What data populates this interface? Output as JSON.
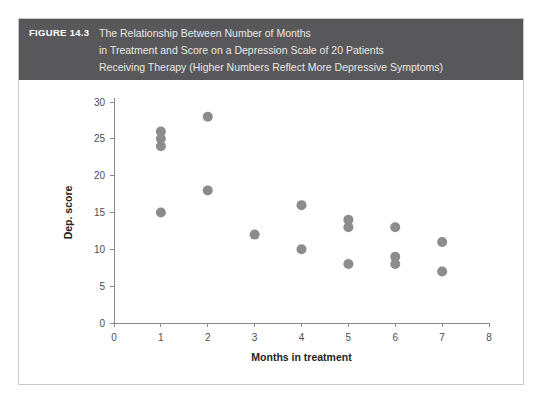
{
  "figure": {
    "number_label": "FIGURE 14.3",
    "caption_lines": [
      "The Relationship Between Number of Months",
      "in Treatment and Score on a Depression Scale of 20 Patients",
      "Receiving Therapy (Higher Numbers Reflect More Depressive Symptoms)"
    ]
  },
  "colors": {
    "band_background": "#58585a",
    "band_number_text": "#ffffff",
    "band_caption_text": "#e9e7e2",
    "marker": "#8c8c8e",
    "axis": "#8a8a8a",
    "frame_border": "#c9c9c9",
    "plot_background": "#ffffff"
  },
  "chart_data": {
    "type": "scatter",
    "title": "",
    "xlabel": "Months in treatment",
    "ylabel": "Dep. score",
    "xlim": [
      0,
      8
    ],
    "ylim": [
      0,
      30
    ],
    "xticks": [
      0,
      1,
      2,
      3,
      4,
      5,
      6,
      7,
      8
    ],
    "xtick_labels": [
      "0",
      "1",
      "2",
      "3",
      "4",
      "5",
      "6",
      "7",
      "8"
    ],
    "yticks": [
      0,
      5,
      10,
      15,
      20,
      25,
      30
    ],
    "ytick_labels": [
      "0",
      "5",
      "10",
      "15",
      "20",
      "25",
      "30"
    ],
    "grid": false,
    "legend": null,
    "n_points": 20,
    "points": [
      {
        "x": 1,
        "y": 26
      },
      {
        "x": 1,
        "y": 25
      },
      {
        "x": 1,
        "y": 24
      },
      {
        "x": 1,
        "y": 15
      },
      {
        "x": 2,
        "y": 28
      },
      {
        "x": 2,
        "y": 18
      },
      {
        "x": 3,
        "y": 12
      },
      {
        "x": 4,
        "y": 16
      },
      {
        "x": 4,
        "y": 10
      },
      {
        "x": 5,
        "y": 14
      },
      {
        "x": 5,
        "y": 13
      },
      {
        "x": 5,
        "y": 8
      },
      {
        "x": 6,
        "y": 13
      },
      {
        "x": 6,
        "y": 9
      },
      {
        "x": 6,
        "y": 8
      },
      {
        "x": 7,
        "y": 11
      },
      {
        "x": 7,
        "y": 7
      }
    ],
    "points_extra_note": ""
  }
}
